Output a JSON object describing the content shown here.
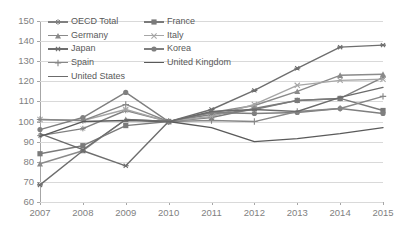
{
  "chart_data": {
    "type": "line",
    "title": "",
    "subtitle": "",
    "xlabel": "(年)",
    "ylabel": "",
    "x_unit_label": "(年)",
    "categories": [
      "2007",
      "2008",
      "2009",
      "2010",
      "2011",
      "2012",
      "2013",
      "2014",
      "2015"
    ],
    "x": [
      2007,
      2008,
      2009,
      2010,
      2011,
      2012,
      2013,
      2014,
      2015
    ],
    "ylim": [
      60,
      150
    ],
    "yticks": [
      60,
      70,
      80,
      90,
      100,
      110,
      120,
      130,
      140,
      150
    ],
    "ytick_labels": [
      "60",
      "70",
      "80",
      "90",
      "100",
      "110",
      "120",
      "130",
      "140",
      "150"
    ],
    "grid": true,
    "legend_position": "top-inside",
    "base_year": 2010,
    "base_value": 100,
    "series": [
      {
        "name": "OECD Total",
        "marker": "star",
        "color": "#808080",
        "values": [
          93.0,
          96.5,
          105.5,
          100.0,
          103.5,
          106.0,
          110.5,
          111.5,
          122.0
        ]
      },
      {
        "name": "France",
        "marker": "square",
        "color": "#7a7a7a",
        "values": [
          84.0,
          88.0,
          98.0,
          100.0,
          102.0,
          106.5,
          110.5,
          111.5,
          105.5
        ]
      },
      {
        "name": "Germany",
        "marker": "triangle",
        "color": "#8a8a8a",
        "values": [
          79.0,
          85.5,
          101.0,
          100.0,
          104.5,
          108.0,
          115.0,
          123.0,
          123.5
        ]
      },
      {
        "name": "Italy",
        "marker": "x",
        "color": "#a6a6a6",
        "values": [
          101.0,
          100.5,
          106.0,
          100.0,
          102.5,
          108.5,
          118.0,
          120.5,
          121.0
        ]
      },
      {
        "name": "Japan",
        "marker": "asterisk",
        "color": "#6e6e6e",
        "values": [
          68.5,
          85.5,
          78.0,
          100.0,
          106.0,
          115.5,
          126.5,
          137.0,
          138.0
        ]
      },
      {
        "name": "Korea",
        "marker": "circle",
        "color": "#7f7f7f",
        "values": [
          96.0,
          102.0,
          114.5,
          100.0,
          104.5,
          104.0,
          104.5,
          106.5,
          104.0
        ]
      },
      {
        "name": "Spain",
        "marker": "plus",
        "color": "#878787",
        "values": [
          101.0,
          100.5,
          108.5,
          100.0,
          100.5,
          100.0,
          105.0,
          106.5,
          112.5
        ]
      },
      {
        "name": "United Kingdom",
        "marker": "none",
        "color": "#5a5a5a",
        "values": [
          92.5,
          100.0,
          100.5,
          100.0,
          97.0,
          90.0,
          91.5,
          94.0,
          97.0
        ]
      },
      {
        "name": "United States",
        "marker": "none",
        "color": "#6b6b6b",
        "values": [
          94.0,
          86.0,
          101.0,
          100.0,
          105.0,
          106.0,
          105.0,
          112.0,
          117.0
        ]
      }
    ]
  },
  "legend": {
    "items": [
      {
        "label": "OECD Total"
      },
      {
        "label": "France"
      },
      {
        "label": "Germany"
      },
      {
        "label": "Italy"
      },
      {
        "label": "Japan"
      },
      {
        "label": "Korea"
      },
      {
        "label": "Spain"
      },
      {
        "label": "United Kingdom"
      },
      {
        "label": "United States"
      }
    ]
  }
}
